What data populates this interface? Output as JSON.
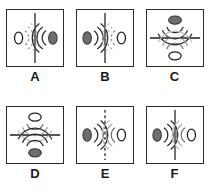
{
  "figure": {
    "type": "diagram",
    "background_color": "#ffffff",
    "columns": 3,
    "rows": 2,
    "colors": {
      "frame": "#2b2b2b",
      "arc_dark": "#1f1f1f",
      "arc_light": "#b3b3b3",
      "divider": "#1f1f1f",
      "ellipse_fill": "#6e6e6e",
      "ellipse_hollow_fill": "#ffffff",
      "ellipse_stroke": "#1f1f1f",
      "label_color": "#1a1a1a"
    }
  },
  "panels": [
    {
      "id": "A",
      "label": "A",
      "divider": {
        "orientation": "vertical",
        "style": "solid"
      },
      "left": {
        "source": "hollow-ellipse",
        "arcs": "dashed",
        "arc_shade": "light",
        "arcs_open": "right"
      },
      "right": {
        "source": "filled-ellipse",
        "arcs": "solid",
        "arc_shade": "dark",
        "arcs_open": "left"
      }
    },
    {
      "id": "B",
      "label": "B",
      "divider": {
        "orientation": "vertical",
        "style": "solid"
      },
      "left": {
        "source": "filled-ellipse",
        "arcs": "solid",
        "arc_shade": "dark",
        "arcs_open": "right"
      },
      "right": {
        "source": "hollow-ellipse",
        "arcs": "dashed",
        "arc_shade": "light",
        "arcs_open": "left"
      }
    },
    {
      "id": "C",
      "label": "C",
      "divider": {
        "orientation": "horizontal",
        "style": "solid"
      },
      "top": {
        "source": "filled-ellipse",
        "arcs": "solid",
        "arc_shade": "dark",
        "arcs_open": "down"
      },
      "bottom": {
        "source": "hollow-ellipse",
        "arcs": "solid",
        "arc_shade": "light",
        "arcs_open": "up"
      }
    },
    {
      "id": "D",
      "label": "D",
      "divider": {
        "orientation": "horizontal",
        "style": "solid"
      },
      "top": {
        "source": "hollow-ellipse",
        "arcs": "solid",
        "arc_shade": "light",
        "arcs_open": "down"
      },
      "bottom": {
        "source": "filled-ellipse",
        "arcs": "solid",
        "arc_shade": "dark",
        "arcs_open": "up"
      }
    },
    {
      "id": "E",
      "label": "E",
      "divider": {
        "orientation": "vertical",
        "style": "dashed"
      },
      "left": {
        "source": "filled-ellipse",
        "arcs": "solid",
        "arc_shade": "dark",
        "arcs_open": "right"
      },
      "right": {
        "source": "hollow-ellipse",
        "arcs": "solid",
        "arc_shade": "light",
        "arcs_open": "left"
      }
    },
    {
      "id": "F",
      "label": "F",
      "divider": {
        "orientation": "vertical",
        "style": "solid"
      },
      "left": {
        "source": "filled-ellipse",
        "arcs": "solid",
        "arc_shade": "dark",
        "arcs_open": "right"
      },
      "right": {
        "source": "hollow-ellipse",
        "arcs": "solid",
        "arc_shade": "light",
        "arcs_open": "left"
      }
    }
  ]
}
